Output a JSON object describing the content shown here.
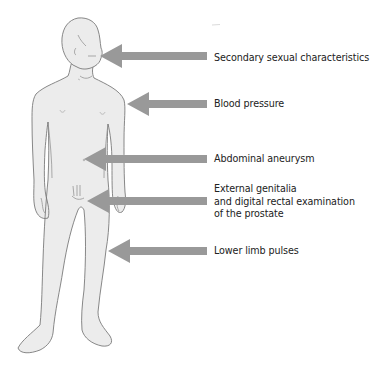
{
  "diagram": {
    "type": "anatomical-annotation",
    "colors": {
      "background": "#ffffff",
      "body_fill": "#ececec",
      "body_outline": "#7a7a7a",
      "arrow": "#999999",
      "label_text": "#222222"
    },
    "annotations": [
      {
        "id": "secondary-sexual",
        "lines": [
          "Secondary sexual characteristics"
        ],
        "arrow_tip": [
          100,
          56
        ],
        "label_y": 52
      },
      {
        "id": "blood-pressure",
        "lines": [
          "Blood pressure"
        ],
        "arrow_tip": [
          127,
          104
        ],
        "label_y": 98
      },
      {
        "id": "abdominal-aneurysm",
        "lines": [
          "Abdominal aneurysm"
        ],
        "arrow_tip": [
          84,
          159
        ],
        "label_y": 153
      },
      {
        "id": "external-genitalia",
        "lines": [
          "External genitalia",
          "and digital rectal examination",
          "of the prostate"
        ],
        "arrow_tip": [
          87,
          201
        ],
        "label_y": 183
      },
      {
        "id": "lower-limb-pulses",
        "lines": [
          "Lower limb pulses"
        ],
        "arrow_tip": [
          108,
          251
        ],
        "label_y": 245
      }
    ]
  }
}
